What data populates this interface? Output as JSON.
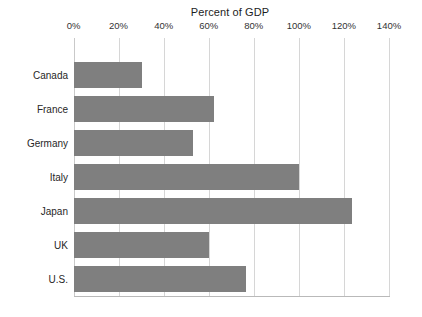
{
  "chart_data": {
    "type": "bar",
    "orientation": "horizontal",
    "title": "Percent of GDP",
    "xlabel": "",
    "ylabel": "",
    "categories": [
      "Canada",
      "France",
      "Germany",
      "Italy",
      "Japan",
      "UK",
      "U.S."
    ],
    "values": [
      30.5,
      62.5,
      53.2,
      100.0,
      123.7,
      60.3,
      76.6
    ],
    "series": [
      {
        "name": "Percent of GDP",
        "values": [
          30.5,
          62.5,
          53.2,
          100.0,
          123.7,
          60.3,
          76.6
        ]
      }
    ],
    "xlim": [
      0,
      140
    ],
    "xticks": [
      0,
      20,
      40,
      60,
      80,
      100,
      120,
      140
    ],
    "xtick_labels": [
      "0%",
      "20%",
      "40%",
      "60%",
      "80%",
      "100%",
      "120%",
      "140%"
    ],
    "grid": true,
    "grid_axis": "x",
    "legend": false,
    "legend_position": "none",
    "bar_color": "#7f7f7f",
    "gridline_color": "#d6d6d6",
    "background_color": "#ffffff",
    "tick_label_position": "top"
  }
}
